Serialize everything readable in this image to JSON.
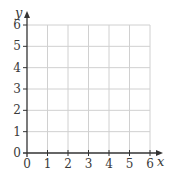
{
  "chart_data": {
    "type": "scatter",
    "title": "",
    "xlabel": "x",
    "ylabel": "y",
    "xlim": [
      0,
      6
    ],
    "ylim": [
      0,
      6
    ],
    "x_ticks": [
      "0",
      "1",
      "2",
      "3",
      "4",
      "5",
      "6"
    ],
    "y_ticks": [
      "0",
      "1",
      "2",
      "3",
      "4",
      "5",
      "6"
    ],
    "grid": true,
    "series": [],
    "legend": null
  },
  "colors": {
    "axis": "#333333",
    "grid": "#d0d0d0",
    "text": "#3a3a3a"
  }
}
